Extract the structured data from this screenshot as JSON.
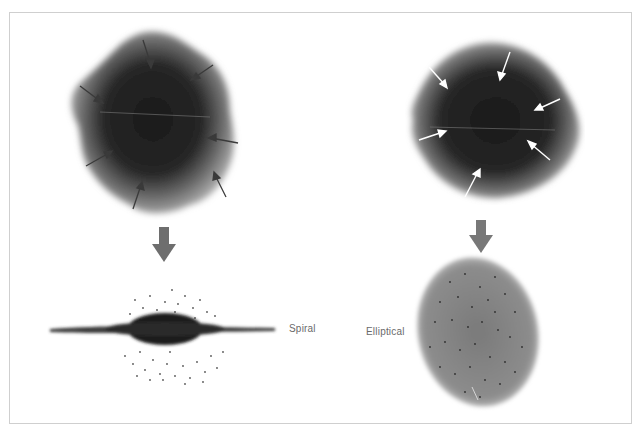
{
  "figure": {
    "colors": {
      "cloud_dark": "#1e1e1e",
      "cloud_edge": "#9a9a9a",
      "arrow_dark": "#3a3a3a",
      "arrow_light": "#ffffff",
      "big_arrow": "#707070",
      "frame": "#cfcfcf",
      "label": "#6a6a6a"
    },
    "left": {
      "cloud": "irregular gas cloud with dark arrows pointing inward",
      "inward_arrow_count": 8,
      "result_label": "Spiral"
    },
    "right": {
      "cloud": "rounded gas cloud with white arrows pointing inward",
      "inward_arrow_count": 7,
      "result_label": "Elliptical"
    }
  }
}
